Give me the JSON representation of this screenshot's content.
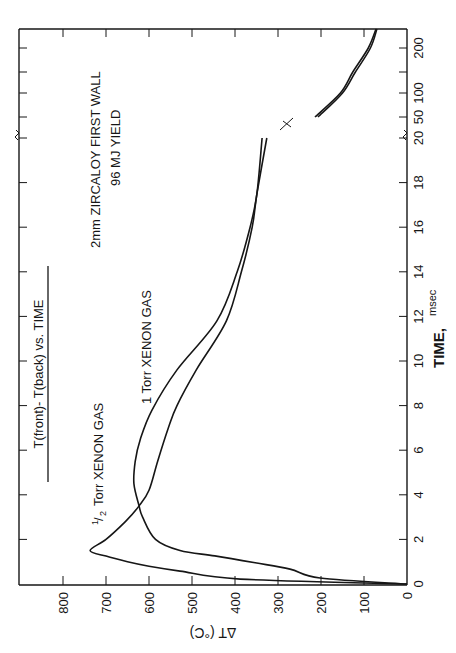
{
  "chart_data": {
    "type": "line",
    "orientation": "rotated-90-ccw",
    "title": "T(front)- T(back) vs. TIME",
    "annotation_lines": [
      "2mm ZIRCALOY  FIRST WALL",
      "96 MJ YIELD"
    ],
    "xlabel": "TIME, msec",
    "xlabel_main": "TIME,",
    "xlabel_unit": "msec",
    "ylabel": "ΔT (°C)",
    "xlim": [
      0,
      250
    ],
    "ylim": [
      0,
      900
    ],
    "x_axis_break": "between 20 and 50 msec",
    "x_ticks_linear": [
      0,
      2,
      4,
      6,
      8,
      10,
      12,
      14,
      16,
      18,
      20
    ],
    "x_tick_labels_linear": [
      "0",
      "2",
      "4",
      "6",
      "8",
      "10",
      "12",
      "14",
      "16",
      "18",
      "20"
    ],
    "x_ticks_broken": [
      50,
      100,
      200
    ],
    "x_tick_labels_broken": [
      "50",
      "100",
      "200"
    ],
    "y_ticks": [
      0,
      100,
      200,
      300,
      400,
      500,
      600,
      700,
      800
    ],
    "y_tick_labels": [
      "0",
      "100",
      "200",
      "300",
      "400",
      "500",
      "600",
      "700",
      "800"
    ],
    "grid": false,
    "legend": "inline curve labels",
    "series": [
      {
        "name": "1/2 Torr XENON GAS",
        "label_prefix": "1/2",
        "label_text": "Torr XENON GAS",
        "x": [
          0,
          0.22,
          0.58,
          0.8,
          1.0,
          1.25,
          1.5,
          2.0,
          2.8,
          3.5,
          4.2,
          5.5,
          7.0,
          8.0,
          9.6,
          11.8,
          14.0,
          16.0,
          17.5,
          20.0,
          50,
          100,
          150,
          200,
          250
        ],
        "values": [
          0,
          388,
          528,
          600,
          650,
          700,
          737,
          700,
          655,
          623,
          600,
          580,
          555,
          535,
          490,
          420,
          385,
          360,
          349,
          326,
          207,
          150,
          120,
          85,
          70
        ]
      },
      {
        "name": "1 Torr XENON GAS",
        "label_text": "1 Torr  XENON GAS",
        "x": [
          0,
          0.27,
          0.67,
          0.95,
          1.26,
          1.5,
          2.0,
          3.0,
          3.5,
          4.5,
          5.5,
          6.5,
          7.8,
          9.6,
          11.8,
          14.0,
          16.0,
          17.5,
          20.0,
          50,
          100,
          150,
          200,
          250
        ],
        "values": [
          0,
          202,
          272,
          353,
          447,
          528,
          585,
          615,
          623,
          635,
          632,
          620,
          593,
          535,
          442,
          395,
          365,
          349,
          337,
          214,
          155,
          126,
          90,
          72
        ]
      }
    ]
  },
  "labels": {
    "title": "T(front)- T(back) vs. TIME",
    "note_line1": "2mm  ZIRCALOY   FIRST  WALL",
    "note_line2": "96  MJ  YIELD",
    "half_torr_num": "1",
    "half_torr_den": "2",
    "half_torr_text": "Torr XENON GAS",
    "one_torr_text": "1 Torr  XENON GAS",
    "x_label": "TIME,",
    "x_unit": "msec",
    "y_label": "ΔT (°C)"
  },
  "colors": {
    "ink": "#161616",
    "paper": "#ffffff"
  }
}
